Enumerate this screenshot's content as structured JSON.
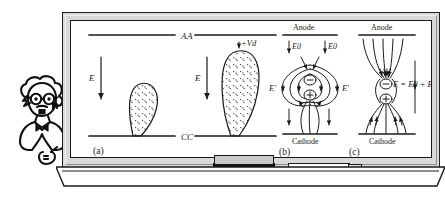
{
  "scene": {
    "title": "Cartoon scientist presenting streamer discharge diagrams on a whiteboard",
    "board_label": "whiteboard",
    "tray_items": [
      {
        "name": "eraser",
        "label": "eraser"
      },
      {
        "name": "marker",
        "label": "marker"
      }
    ]
  },
  "character": {
    "name": "cartoon-scientist",
    "description": "Einstein-like figure with wild hair, round glasses, bow tie, pointing hand"
  },
  "figure": {
    "panels": [
      {
        "id": "a",
        "caption": "(a)",
        "anode_labels": [
          "A",
          "A"
        ],
        "cathode_labels": [
          "C",
          "C"
        ],
        "field_labels": [
          "E",
          "E"
        ],
        "voltage_label": "+Vd",
        "streamers": [
          {
            "size": "small",
            "shape": "teardrop",
            "fill": "stippled"
          },
          {
            "size": "large",
            "shape": "teardrop",
            "fill": "stippled"
          }
        ]
      },
      {
        "id": "b",
        "caption": "(b)",
        "anode_label": "Anode",
        "cathode_label": "Cathode",
        "applied_field_labels": [
          "E0",
          "E0"
        ],
        "induced_field_labels": [
          "E'",
          "E'"
        ],
        "charges": [
          "⊖",
          "⊕"
        ],
        "description": "dipole field lines of space charge"
      },
      {
        "id": "c",
        "caption": "(c)",
        "anode_label": "Anode",
        "cathode_label": "Cathode",
        "resultant_field_label": "E = E0 + E'",
        "charges": [
          "⊖",
          "⊕"
        ],
        "description": "resultant superposed field"
      }
    ]
  },
  "colors": {
    "ink": "#1a1a1a",
    "board_fill": "#ffffff",
    "frame": "#d9d9d9",
    "frame_edge": "#202020",
    "eraser_felt": "#111111",
    "stipple": "#444444"
  }
}
